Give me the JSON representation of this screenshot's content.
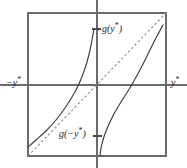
{
  "figure": {
    "type": "math-plot",
    "title": "",
    "background_color": "#ffffff",
    "line_color": "#3c3c3c",
    "frame_color": "#6b6b6b",
    "axis_color": "#6b6b6b",
    "dash_color": "#8a8a8a",
    "labels": {
      "neg_y_star": {
        "base": "−y",
        "sup": "*"
      },
      "y_star": {
        "base": "y",
        "sup": "*"
      },
      "g_y_star": {
        "base": "g(y",
        "sup": "*",
        "tail": ")"
      },
      "g_neg_y_star": {
        "base": "g(−y",
        "sup": "*",
        "tail": ")"
      }
    }
  },
  "chart_data": {
    "type": "line",
    "title": "",
    "xlabel": "",
    "ylabel": "",
    "xlim": [
      -1,
      1
    ],
    "ylim": [
      -1,
      1
    ],
    "grid": false,
    "legend": false,
    "frame": {
      "x0": 28,
      "y0": 13,
      "x1": 166,
      "y1": 156
    },
    "origin": {
      "x": 97,
      "y": 85
    },
    "axes": [
      {
        "name": "horizontal-axis",
        "from": [
          0,
          85
        ],
        "to": [
          187,
          85
        ],
        "style": "solid"
      },
      {
        "name": "vertical-axis",
        "from": [
          97,
          0
        ],
        "to": [
          97,
          168
        ],
        "style": "solid"
      }
    ],
    "ticks": [
      {
        "name": "tick-g-y-star",
        "x": 97,
        "y": 29
      },
      {
        "name": "tick-g-neg-y-star",
        "x": 97,
        "y": 136
      }
    ],
    "series": [
      {
        "name": "identity-line",
        "label": "y = x",
        "style": "dashed",
        "points": [
          [
            28,
            156
          ],
          [
            166,
            13
          ]
        ]
      },
      {
        "name": "left-branch",
        "label": "g(−y*) branch",
        "style": "solid",
        "points": [
          [
            28,
            147
          ],
          [
            36,
            140
          ],
          [
            46,
            131
          ],
          [
            56,
            120
          ],
          [
            65,
            108
          ],
          [
            72,
            97
          ],
          [
            78,
            86
          ],
          [
            83,
            74
          ],
          [
            87,
            62
          ],
          [
            90,
            50
          ],
          [
            92,
            40
          ],
          [
            94,
            29
          ]
        ]
      },
      {
        "name": "right-branch",
        "label": "g(y*) branch",
        "style": "solid",
        "points": [
          [
            100,
            156
          ],
          [
            101,
            148
          ],
          [
            103,
            140
          ],
          [
            106,
            131
          ],
          [
            110,
            122
          ],
          [
            115,
            112
          ],
          [
            121,
            102
          ],
          [
            128,
            91
          ],
          [
            135,
            79
          ],
          [
            142,
            66
          ],
          [
            149,
            52
          ],
          [
            156,
            38
          ],
          [
            163,
            25
          ]
        ]
      }
    ],
    "annotations": [
      {
        "name": "neg-y-star-label",
        "text": "−y*",
        "x": 6,
        "y": 78
      },
      {
        "name": "y-star-label",
        "text": "y*",
        "x": 171,
        "y": 78
      },
      {
        "name": "g-y-star-label",
        "text": "g(y*)",
        "x": 102,
        "y": 24
      },
      {
        "name": "g-neg-y-star-label",
        "text": "g(−y*)",
        "x": 59,
        "y": 129
      }
    ]
  }
}
